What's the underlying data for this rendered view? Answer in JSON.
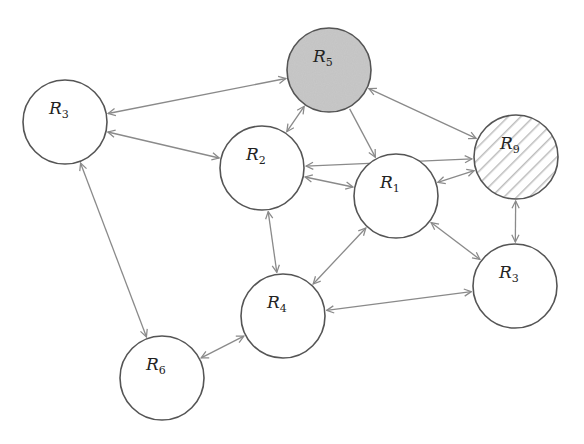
{
  "diagram": {
    "type": "network-graph",
    "background": "#ffffff",
    "edge_color": "#8a8a8a",
    "node_stroke": "#555555",
    "node_radius": 42,
    "nodes": [
      {
        "id": "n_r3_left",
        "label": "R",
        "sub": "3",
        "cx": 65,
        "cy": 122,
        "fill": "none"
      },
      {
        "id": "n_r5",
        "label": "R",
        "sub": "5",
        "cx": 329,
        "cy": 70,
        "fill": "gray",
        "fill_color": "#c8c8c8"
      },
      {
        "id": "n_r9",
        "label": "R",
        "sub": "9",
        "cx": 516,
        "cy": 157,
        "fill": "hatched",
        "hatch_color": "#bdbdbd"
      },
      {
        "id": "n_r2",
        "label": "R",
        "sub": "2",
        "cx": 262,
        "cy": 168,
        "fill": "none"
      },
      {
        "id": "n_r1",
        "label": "R",
        "sub": "1",
        "cx": 396,
        "cy": 196,
        "fill": "none"
      },
      {
        "id": "n_r3_right",
        "label": "R",
        "sub": "3",
        "cx": 515,
        "cy": 286,
        "fill": "none"
      },
      {
        "id": "n_r4",
        "label": "R",
        "sub": "4",
        "cx": 283,
        "cy": 316,
        "fill": "none"
      },
      {
        "id": "n_r6",
        "label": "R",
        "sub": "6",
        "cx": 162,
        "cy": 378,
        "fill": "none"
      }
    ],
    "edges": [
      {
        "from": "n_r3_left",
        "to": "n_r5",
        "direction": "both"
      },
      {
        "from": "n_r3_left",
        "to": "n_r2",
        "direction": "both"
      },
      {
        "from": "n_r3_left",
        "to": "n_r6",
        "direction": "both"
      },
      {
        "from": "n_r5",
        "to": "n_r2",
        "direction": "both"
      },
      {
        "from": "n_r5",
        "to": "n_r1",
        "direction": "forward"
      },
      {
        "from": "n_r5",
        "to": "n_r9",
        "direction": "both"
      },
      {
        "from": "n_r9",
        "to": "n_r2",
        "direction": "both"
      },
      {
        "from": "n_r9",
        "to": "n_r1",
        "direction": "both"
      },
      {
        "from": "n_r9",
        "to": "n_r3_right",
        "direction": "both"
      },
      {
        "from": "n_r2",
        "to": "n_r1",
        "direction": "both"
      },
      {
        "from": "n_r2",
        "to": "n_r4",
        "direction": "both"
      },
      {
        "from": "n_r1",
        "to": "n_r4",
        "direction": "both"
      },
      {
        "from": "n_r1",
        "to": "n_r3_right",
        "direction": "both"
      },
      {
        "from": "n_r4",
        "to": "n_r3_right",
        "direction": "both"
      },
      {
        "from": "n_r6",
        "to": "n_r4",
        "direction": "both"
      }
    ]
  }
}
